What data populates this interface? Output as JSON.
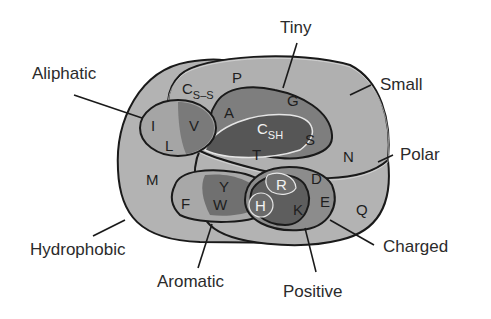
{
  "diagram": {
    "type": "venn",
    "colors": {
      "background": "#ffffff",
      "base": "#b3b3b3",
      "level2": "#8e8e8e",
      "level3": "#6f6f6f",
      "level4": "#565656",
      "outline": "#1a1a1a",
      "inner_outline": "#e6e6e6"
    },
    "set_labels": {
      "aliphatic": "Aliphatic",
      "tiny": "Tiny",
      "small": "Small",
      "polar": "Polar",
      "hydrophobic": "Hydrophobic",
      "aromatic": "Aromatic",
      "positive": "Positive",
      "charged": "Charged"
    },
    "residues": {
      "I": "I",
      "L": "L",
      "V": "V",
      "P": "P",
      "A": "A",
      "G": "G",
      "C_ss": "C",
      "C_ss_sub": "S–S",
      "C_sh": "C",
      "C_sh_sub": "SH",
      "S": "S",
      "T": "T",
      "N": "N",
      "D": "D",
      "M": "M",
      "F": "F",
      "Y": "Y",
      "W": "W",
      "H": "H",
      "R": "R",
      "K": "K",
      "E": "E",
      "Q": "Q"
    },
    "membership": {
      "Hydrophobic": [
        "I",
        "L",
        "V",
        "C",
        "A",
        "G",
        "T",
        "M",
        "F",
        "Y",
        "W",
        "H",
        "K"
      ],
      "Aliphatic": [
        "I",
        "L",
        "V"
      ],
      "Aromatic": [
        "F",
        "Y",
        "W",
        "H"
      ],
      "Small": [
        "V",
        "P",
        "A",
        "G",
        "C",
        "S",
        "T",
        "N",
        "D"
      ],
      "Tiny": [
        "A",
        "G",
        "C",
        "S"
      ],
      "Polar": [
        "Y",
        "W",
        "H",
        "K",
        "R",
        "E",
        "D",
        "T",
        "S",
        "N",
        "Q",
        "C"
      ],
      "Charged": [
        "H",
        "K",
        "R",
        "E",
        "D"
      ],
      "Positive": [
        "H",
        "K",
        "R"
      ]
    }
  }
}
